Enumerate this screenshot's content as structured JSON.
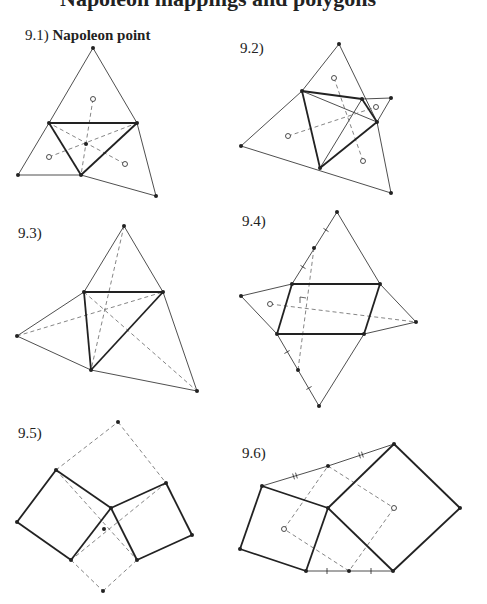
{
  "header": {
    "text": "Napoleon mappings and polygons"
  },
  "colors": {
    "ink": "#222222",
    "dash": "#666666",
    "background": "#ffffff"
  },
  "panels": [
    {
      "id": "9.1",
      "number": "9.1)",
      "title": "Napoleon point",
      "label_pos": [
        25,
        27
      ],
      "solid": [
        [
          93,
          48,
          49,
          123
        ],
        [
          93,
          48,
          137,
          123
        ],
        [
          18,
          175,
          49,
          123
        ],
        [
          18,
          175,
          81,
          175
        ],
        [
          137,
          123,
          156,
          196
        ],
        [
          81,
          175,
          156,
          196
        ]
      ],
      "bold": [
        [
          49,
          123,
          137,
          123
        ],
        [
          137,
          123,
          81,
          175
        ],
        [
          81,
          175,
          49,
          123
        ]
      ],
      "dashed": [
        [
          93,
          99,
          81,
          175
        ],
        [
          49,
          157,
          137,
          123
        ],
        [
          125,
          164,
          49,
          123
        ]
      ],
      "dots": [
        [
          93,
          48
        ],
        [
          49,
          123
        ],
        [
          137,
          123
        ],
        [
          81,
          175
        ],
        [
          18,
          175
        ],
        [
          156,
          196
        ],
        [
          86,
          144
        ]
      ],
      "open": [
        [
          93,
          99
        ],
        [
          49,
          157
        ],
        [
          125,
          164
        ]
      ],
      "ticks": []
    },
    {
      "id": "9.2",
      "number": "9.2)",
      "title": "",
      "label_pos": [
        240,
        40
      ],
      "solid": [
        [
          339,
          44,
          302,
          91
        ],
        [
          339,
          44,
          377,
          122
        ],
        [
          241,
          146,
          302,
          91
        ],
        [
          241,
          146,
          391,
          193
        ],
        [
          391,
          193,
          377,
          122
        ],
        [
          362,
          99,
          391,
          98
        ],
        [
          391,
          98,
          377,
          122
        ],
        [
          302,
          91,
          377,
          122
        ],
        [
          362,
          99,
          320,
          168
        ]
      ],
      "bold": [
        [
          302,
          91,
          362,
          99
        ],
        [
          362,
          99,
          377,
          122
        ],
        [
          377,
          122,
          320,
          168
        ],
        [
          320,
          168,
          302,
          91
        ]
      ],
      "dashed": [
        [
          334,
          78,
          363,
          161
        ],
        [
          288,
          136,
          376,
          107
        ]
      ],
      "dots": [
        [
          339,
          44
        ],
        [
          302,
          91
        ],
        [
          362,
          99
        ],
        [
          377,
          122
        ],
        [
          320,
          168
        ],
        [
          241,
          146
        ],
        [
          391,
          98
        ],
        [
          391,
          193
        ]
      ],
      "open": [
        [
          334,
          78
        ],
        [
          376,
          107
        ],
        [
          288,
          136
        ],
        [
          363,
          161
        ]
      ],
      "ticks": []
    },
    {
      "id": "9.3",
      "number": "9.3)",
      "title": "",
      "label_pos": [
        18,
        225
      ],
      "solid": [
        [
          124,
          226,
          84,
          292
        ],
        [
          124,
          226,
          163,
          292
        ],
        [
          17,
          336,
          84,
          292
        ],
        [
          17,
          336,
          91,
          370
        ],
        [
          91,
          370,
          197,
          391
        ],
        [
          163,
          292,
          197,
          391
        ]
      ],
      "bold": [
        [
          84,
          292,
          163,
          292
        ],
        [
          163,
          292,
          91,
          370
        ],
        [
          91,
          370,
          84,
          292
        ]
      ],
      "dashed": [
        [
          124,
          226,
          91,
          370
        ],
        [
          17,
          336,
          163,
          292
        ],
        [
          84,
          292,
          197,
          391
        ]
      ],
      "dots": [
        [
          124,
          226
        ],
        [
          84,
          292
        ],
        [
          163,
          292
        ],
        [
          91,
          370
        ],
        [
          17,
          336
        ],
        [
          197,
          391
        ]
      ],
      "open": [],
      "ticks": []
    },
    {
      "id": "9.4",
      "number": "9.4)",
      "title": "",
      "label_pos": [
        242,
        213
      ],
      "solid": [
        [
          337,
          212,
          292,
          284
        ],
        [
          337,
          212,
          380,
          284
        ],
        [
          241,
          296,
          292,
          284
        ],
        [
          241,
          296,
          277,
          334
        ],
        [
          380,
          284,
          416,
          322
        ],
        [
          416,
          322,
          364,
          334
        ],
        [
          277,
          334,
          319,
          406
        ],
        [
          364,
          334,
          319,
          406
        ]
      ],
      "bold": [
        [
          292,
          284,
          380,
          284
        ],
        [
          380,
          284,
          364,
          334
        ],
        [
          364,
          334,
          277,
          334
        ],
        [
          277,
          334,
          292,
          284
        ]
      ],
      "dashed": [
        [
          314,
          248,
          298,
          370
        ],
        [
          270,
          304,
          416,
          322
        ]
      ],
      "dots": [
        [
          337,
          212
        ],
        [
          314,
          248
        ],
        [
          292,
          284
        ],
        [
          380,
          284
        ],
        [
          364,
          334
        ],
        [
          277,
          334
        ],
        [
          241,
          296
        ],
        [
          416,
          322
        ],
        [
          298,
          370
        ],
        [
          319,
          406
        ]
      ],
      "open": [
        [
          270,
          304
        ]
      ],
      "ticks": [
        [
          326,
          230
        ],
        [
          303,
          267
        ],
        [
          287,
          352
        ],
        [
          309,
          388
        ]
      ]
    },
    {
      "id": "9.5",
      "number": "9.5)",
      "title": "",
      "label_pos": [
        18,
        425
      ],
      "solid": [],
      "bold": [
        [
          56,
          470,
          111,
          508
        ],
        [
          111,
          508,
          71,
          560
        ],
        [
          71,
          560,
          17,
          522
        ],
        [
          17,
          522,
          56,
          470
        ],
        [
          111,
          508,
          166,
          483
        ],
        [
          166,
          483,
          192,
          535
        ],
        [
          192,
          535,
          137,
          560
        ],
        [
          137,
          560,
          111,
          508
        ]
      ],
      "dashed": [
        [
          56,
          470,
          118,
          422
        ],
        [
          118,
          422,
          166,
          483
        ],
        [
          56,
          470,
          137,
          560
        ],
        [
          166,
          483,
          71,
          560
        ],
        [
          71,
          560,
          103,
          591
        ],
        [
          103,
          591,
          137,
          560
        ]
      ],
      "dots": [
        [
          118,
          422
        ],
        [
          56,
          470
        ],
        [
          17,
          522
        ],
        [
          71,
          560
        ],
        [
          111,
          508
        ],
        [
          166,
          483
        ],
        [
          192,
          535
        ],
        [
          137,
          560
        ],
        [
          104,
          529
        ],
        [
          103,
          591
        ]
      ],
      "open": [],
      "ticks": []
    },
    {
      "id": "9.6",
      "number": "9.6)",
      "title": "",
      "label_pos": [
        242,
        445
      ],
      "solid": [
        [
          262,
          486,
          328,
          466
        ],
        [
          328,
          466,
          394,
          444
        ],
        [
          306,
          571,
          349,
          571
        ],
        [
          349,
          571,
          393,
          571
        ]
      ],
      "bold": [
        [
          262,
          486,
          328,
          508
        ],
        [
          328,
          508,
          306,
          571
        ],
        [
          306,
          571,
          240,
          549
        ],
        [
          240,
          549,
          262,
          486
        ],
        [
          328,
          508,
          394,
          444
        ],
        [
          394,
          444,
          460,
          508
        ],
        [
          460,
          508,
          393,
          571
        ],
        [
          393,
          571,
          328,
          508
        ]
      ],
      "dashed": [
        [
          328,
          466,
          394,
          508
        ],
        [
          394,
          508,
          349,
          571
        ],
        [
          349,
          571,
          284,
          529
        ],
        [
          284,
          529,
          328,
          466
        ]
      ],
      "dots": [
        [
          394,
          444
        ],
        [
          460,
          508
        ],
        [
          393,
          571
        ],
        [
          328,
          508
        ],
        [
          262,
          486
        ],
        [
          240,
          549
        ],
        [
          306,
          571
        ],
        [
          328,
          466
        ],
        [
          349,
          571
        ]
      ],
      "open": [
        [
          284,
          529
        ],
        [
          394,
          508
        ]
      ],
      "ticks": [],
      "double_ticks": [
        [
          295,
          476
        ],
        [
          361,
          455
        ]
      ],
      "single_ticks": [
        [
          327,
          571
        ],
        [
          371,
          571
        ]
      ]
    }
  ]
}
